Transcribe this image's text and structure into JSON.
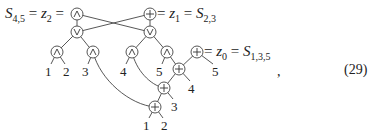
{
  "equation": {
    "number": "(29)",
    "trailing_punct": ",",
    "labels": {
      "z2": {
        "lhs": "S",
        "lhs_sub": "4,5",
        "eq1": " = ",
        "mid": "z",
        "mid_sub": "2",
        "eq2": " = "
      },
      "z1": {
        "eq1": " = ",
        "mid": "z",
        "mid_sub": "1",
        "eq2": " = ",
        "rhs": "S",
        "rhs_sub": "2,3"
      },
      "z0": {
        "eq1": " = ",
        "mid": "z",
        "mid_sub": "0",
        "eq2": " = ",
        "rhs": "S",
        "rhs_sub": "1,3,5"
      }
    }
  },
  "diagram": {
    "nodes": [
      {
        "id": "and_top",
        "op": "∧",
        "x": 77,
        "y": 14
      },
      {
        "id": "plus_top",
        "op": "⊕",
        "x": 150,
        "y": 14
      },
      {
        "id": "or_left",
        "op": "∨",
        "x": 77,
        "y": 32
      },
      {
        "id": "or_right",
        "op": "∨",
        "x": 150,
        "y": 32
      },
      {
        "id": "and_l1",
        "op": "∧",
        "x": 57,
        "y": 52
      },
      {
        "id": "and_l2",
        "op": "∧",
        "x": 93,
        "y": 52
      },
      {
        "id": "and_r1",
        "op": "∧",
        "x": 132,
        "y": 52
      },
      {
        "id": "and_r2",
        "op": "∧",
        "x": 167,
        "y": 52
      },
      {
        "id": "plus_z0",
        "op": "⊕",
        "x": 197,
        "y": 52
      },
      {
        "id": "plus_a",
        "op": "⊕",
        "x": 179,
        "y": 69
      },
      {
        "id": "plus_b",
        "op": "⊕",
        "x": 164,
        "y": 88
      },
      {
        "id": "plus_c",
        "op": "⊕",
        "x": 155,
        "y": 107
      }
    ],
    "leaves": [
      {
        "text": "1",
        "x": 48,
        "y": 73
      },
      {
        "text": "2",
        "x": 66,
        "y": 73
      },
      {
        "text": "3",
        "x": 85,
        "y": 73
      },
      {
        "text": "4",
        "x": 123,
        "y": 73
      },
      {
        "text": "5",
        "x": 159,
        "y": 73
      },
      {
        "text": "5",
        "x": 215,
        "y": 73
      },
      {
        "text": "4",
        "x": 191,
        "y": 90
      },
      {
        "text": "3",
        "x": 174,
        "y": 108
      },
      {
        "text": "1",
        "x": 146,
        "y": 127
      },
      {
        "text": "2",
        "x": 164,
        "y": 127
      }
    ]
  }
}
